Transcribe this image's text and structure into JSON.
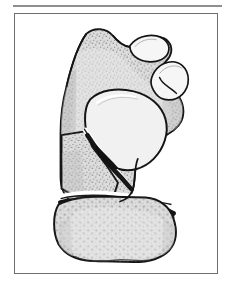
{
  "figure": {
    "title": "Bone fracture anatomical illustration",
    "frame": {
      "border_color": "#6e6e6e",
      "background": "#ffffff",
      "rule_color": "#8e8e8e"
    },
    "illustration": {
      "subject": "tarsal bone with comminuted fracture",
      "view": "lateral / sagittal section",
      "style": "line drawing with stipple shading",
      "colors": {
        "outline": "#1a1a1a",
        "cortical_fill": "#d6d6d6",
        "cancellous_fill": "#e2e2e2",
        "cavity_fill": "#f2f2f2",
        "facet_fill": "#f4f4f4",
        "fracture_gap": "#141414",
        "highlight": "#ffffff",
        "stipple": "#6b6b6b"
      },
      "parts": [
        {
          "name": "proximal-bone-body",
          "label": "Proximal bone body"
        },
        {
          "name": "posterior-articular-facet",
          "label": "Posterior articular facet"
        },
        {
          "name": "anterior-articular-facet",
          "label": "Anterior articular facet"
        },
        {
          "name": "central-cavity",
          "label": "Central medullary cavity"
        },
        {
          "name": "wedge-fragment",
          "label": "Displaced wedge fragment"
        },
        {
          "name": "oblique-fracture-line",
          "label": "Oblique fracture line"
        },
        {
          "name": "transverse-fracture-line",
          "label": "Transverse fracture line"
        },
        {
          "name": "distal-bone-fragment",
          "label": "Distal bone fragment"
        }
      ]
    }
  }
}
